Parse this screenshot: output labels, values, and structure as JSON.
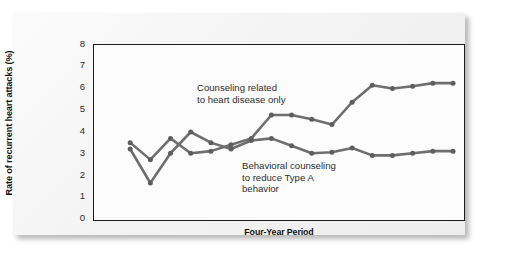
{
  "axes": {
    "y_title": "Rate of recurrent heart attacks (%)",
    "x_title": "Four-Year Period",
    "y_ticks": [
      "8",
      "7",
      "6",
      "5",
      "4",
      "3",
      "2",
      "1",
      "0"
    ]
  },
  "annotations": {
    "upper": "Counseling related\nto heart disease only",
    "lower": "Behavioral counseling\nto reduce Type A\nbehavior"
  },
  "colors": {
    "line": "#6e6e6e",
    "marker": "#5e5e5e",
    "frame": "#1c1c1c",
    "plot_background": "#fcfcfc",
    "card_background": "#f4f4f4",
    "text": "#111111"
  },
  "chart_data": {
    "type": "line",
    "title": "",
    "subtitle": "",
    "xlabel": "Four-Year Period",
    "ylabel": "Rate of recurrent heart attacks (%)",
    "ylim": [
      0,
      8
    ],
    "xlim": [
      0,
      17
    ],
    "ytick_values": [
      0,
      1,
      2,
      3,
      4,
      5,
      6,
      7,
      8
    ],
    "xtick_values": [],
    "grid": false,
    "legend": "inline-annotations",
    "legend_position": "inside-plot",
    "series": [
      {
        "name": "Counseling related to heart disease only",
        "color": "#6e6e6e",
        "x": [
          1,
          2,
          3,
          4,
          5,
          6,
          7,
          8,
          9,
          10,
          11,
          12,
          13,
          14,
          15,
          16,
          17
        ],
        "values": [
          3.5,
          2.7,
          3.7,
          3.0,
          3.1,
          3.4,
          3.7,
          4.8,
          4.8,
          4.6,
          4.35,
          5.4,
          6.2,
          6.05,
          6.15,
          6.3,
          6.3
        ]
      },
      {
        "name": "Behavioral counseling to reduce Type A behavior",
        "color": "#6e6e6e",
        "x": [
          1,
          2,
          3,
          4,
          5,
          6,
          7,
          8,
          9,
          10,
          11,
          12,
          13,
          14,
          15,
          16,
          17
        ],
        "values": [
          3.2,
          1.6,
          3.0,
          4.0,
          3.5,
          3.2,
          3.6,
          3.7,
          3.35,
          3.0,
          3.05,
          3.25,
          2.9,
          2.9,
          3.0,
          3.1,
          3.1
        ]
      }
    ]
  }
}
